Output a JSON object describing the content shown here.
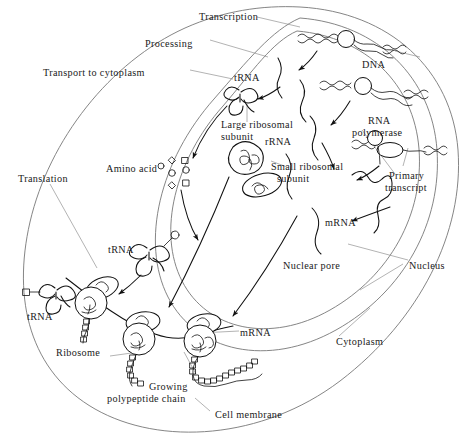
{
  "diagram": {
    "colors": {
      "ink": "#111111",
      "membrane": "#777777",
      "leader": "#8a8a8a",
      "background": "#ffffff"
    }
  },
  "labels": {
    "transcription": "Transcription",
    "processing": "Processing",
    "transport_to_cytoplasm": "Transport to cytoplasm",
    "translation": "Translation",
    "dna": "DNA",
    "rna_polymerase_line1": "RNA",
    "rna_polymerase_line2": "polymerase",
    "primary_transcript_line1": "Primary",
    "primary_transcript_line2": "transcript",
    "trna_nucleus": "tRNA",
    "trna_cytoplasm_mid": "tRNA",
    "trna_cytoplasm_left": "tRNA",
    "large_ribosomal_line1": "Large ribosomal",
    "large_ribosomal_line2": "subunit",
    "small_ribosomal_line1": "Small ribosomal",
    "small_ribosomal_line2": "subunit",
    "rrna": "rRNA",
    "amino_acid": "Amino acid",
    "mrna_nucleus": "mRNA",
    "mrna_cytoplasm": "mRNA",
    "nuclear_pore": "Nuclear pore",
    "nucleus": "Nucleus",
    "cytoplasm": "Cytoplasm",
    "ribosome": "Ribosome",
    "growing_polypeptide_line1": "Growing",
    "growing_polypeptide_line2": "polypeptide chain",
    "cell_membrane": "Cell membrane"
  },
  "structures": {
    "dna_strands": 3,
    "rna_polymerase_count": 3,
    "ribosomes_on_mrna": 3,
    "trna_molecules": 3,
    "amino_acid_shapes": [
      "diamond",
      "square",
      "circle",
      "square",
      "circle",
      "diamond",
      "square"
    ],
    "nuclear_envelope_layers": 2,
    "cell_membrane_layers": 1
  }
}
